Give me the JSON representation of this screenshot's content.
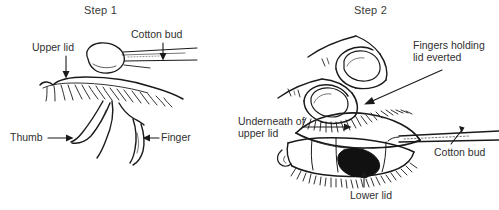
{
  "figure": {
    "background_color": "#ffffff",
    "ink_color": "#1a1a1a",
    "text_color": "#2f2f2f",
    "width": 499,
    "height": 210
  },
  "panels": [
    {
      "id": "step-1",
      "title": "Step 1",
      "labels": [
        {
          "id": "upper-lid",
          "text": "Upper lid",
          "arrow": "down"
        },
        {
          "id": "cotton-bud",
          "text": "Cotton bud",
          "arrow": "down"
        },
        {
          "id": "thumb",
          "text": "Thumb",
          "arrow": "right"
        },
        {
          "id": "finger",
          "text": "Finger",
          "arrow": "left"
        }
      ]
    },
    {
      "id": "step-2",
      "title": "Step 2",
      "labels": [
        {
          "id": "fingers-holding-lid-everted",
          "text": "Fingers holding lid everted",
          "arrow": "leader-left"
        },
        {
          "id": "underneath-of-upper-lid",
          "text": "Underneath of upper lid",
          "arrow": "right"
        },
        {
          "id": "cotton-bud",
          "text": "Cotton bud",
          "arrow": "leader-up"
        },
        {
          "id": "lower-lid",
          "text": "Lower lid",
          "arrow": "up"
        }
      ]
    }
  ]
}
